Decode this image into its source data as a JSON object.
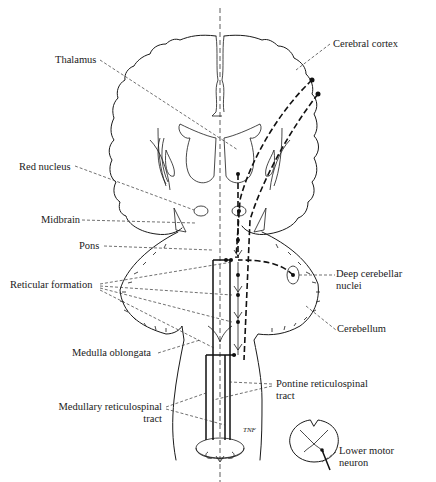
{
  "diagram": {
    "type": "neuroanatomy-schematic",
    "labels": {
      "thalamus": "Thalamus",
      "cerebral_cortex": "Cerebral cortex",
      "red_nucleus": "Red nucleus",
      "midbrain": "Midbrain",
      "pons": "Pons",
      "reticular_formation": "Reticular formation",
      "deep_cerebellar_nuclei_line1": "Deep cerebellar",
      "deep_cerebellar_nuclei_line2": "nuclei",
      "cerebellum": "Cerebellum",
      "medulla_oblongata": "Medulla oblongata",
      "pontine_rst_line1": "Pontine reticulospinal",
      "pontine_rst_line2": "tract",
      "medullary_rst_line1": "Medullary reticulospinal",
      "medullary_rst_line2": "tract",
      "lower_motor_neuron_line1": "Lower motor",
      "lower_motor_neuron_line2": "neuron",
      "artist_initials": "TNF"
    },
    "colors": {
      "ink": "#1a1a1a",
      "background": "#ffffff"
    }
  }
}
